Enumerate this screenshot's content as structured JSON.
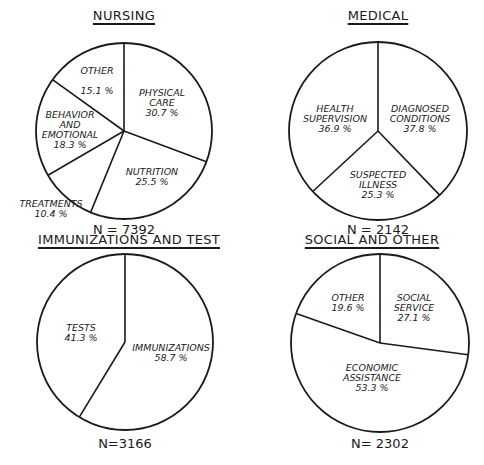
{
  "chart_data": [
    {
      "type": "pie",
      "title": "NURSING",
      "n_label": "N = 7392",
      "categories": [
        "PHYSICAL CARE",
        "NUTRITION",
        "TREATMENTS",
        "BEHAVIOR AND EMOTIONAL",
        "OTHER"
      ],
      "values": [
        30.7,
        25.5,
        10.4,
        18.3,
        15.1
      ],
      "value_labels": [
        "30.7 %",
        "25.5 %",
        "10.4 %",
        "18.3 %",
        "15.1 %"
      ],
      "start_angle": "top, clockwise"
    },
    {
      "type": "pie",
      "title": "MEDICAL",
      "n_label": "N = 2142",
      "categories": [
        "DIAGNOSED CONDITIONS",
        "SUSPECTED ILLNESS",
        "HEALTH SUPERVISION"
      ],
      "values": [
        37.8,
        25.3,
        36.9
      ],
      "value_labels": [
        "37.8 %",
        "25.3 %",
        "36.9 %"
      ],
      "start_angle": "top, clockwise"
    },
    {
      "type": "pie",
      "title": "IMMUNIZATIONS AND TEST",
      "n_label": "N=3166",
      "categories": [
        "IMMUNIZATIONS",
        "TESTS"
      ],
      "values": [
        58.7,
        41.3
      ],
      "value_labels": [
        "58.7 %",
        "41.3 %"
      ],
      "start_angle": "top, clockwise"
    },
    {
      "type": "pie",
      "title": "SOCIAL AND OTHER",
      "n_label": "N= 2302",
      "categories": [
        "SOCIAL SERVICE",
        "ECONOMIC ASSISTANCE",
        "OTHER"
      ],
      "values": [
        27.1,
        53.3,
        19.6
      ],
      "value_labels": [
        "27.1 %",
        "53.3 %",
        "19.6 %"
      ],
      "start_angle": "top, clockwise"
    }
  ],
  "charts": [
    {
      "title": "NURSING",
      "title_pos": [
        124,
        8
      ],
      "n_label": "N = 7392",
      "n_pos": [
        124,
        222
      ],
      "cx": 124,
      "cy": 131,
      "r": 88,
      "values": [
        30.7,
        25.5,
        10.4,
        18.3,
        15.1
      ],
      "labels": [
        {
          "lines": [
            "PHYSICAL",
            "CARE",
            "30.7 %"
          ],
          "pos": [
            162,
            88
          ]
        },
        {
          "lines": [
            "NUTRITION",
            "25.5 %"
          ],
          "pos": [
            152,
            167
          ]
        },
        {
          "lines": [
            "TREATMENTS",
            "10.4 %"
          ],
          "pos": [
            51,
            199
          ]
        },
        {
          "lines": [
            "BEHAVIOR",
            "AND",
            "EMOTIONAL",
            "18.3 %"
          ],
          "pos": [
            70,
            110
          ]
        },
        {
          "lines": [
            "OTHER",
            "",
            "15.1 %"
          ],
          "pos": [
            97,
            66
          ]
        }
      ]
    },
    {
      "title": "MEDICAL",
      "title_pos": [
        378,
        8
      ],
      "n_label": "N = 2142",
      "n_pos": [
        378,
        222
      ],
      "cx": 378,
      "cy": 131,
      "r": 89,
      "values": [
        37.8,
        25.3,
        36.9
      ],
      "labels": [
        {
          "lines": [
            "DIAGNOSED",
            "CONDITIONS",
            "37.8 %"
          ],
          "pos": [
            420,
            104
          ]
        },
        {
          "lines": [
            "SUSPECTED",
            "ILLNESS",
            "25.3 %"
          ],
          "pos": [
            378,
            170
          ]
        },
        {
          "lines": [
            "HEALTH",
            "SUPERVISION",
            "36.9 %"
          ],
          "pos": [
            335,
            104
          ]
        }
      ]
    },
    {
      "title": "IMMUNIZATIONS AND TEST",
      "title_pos": [
        129,
        232
      ],
      "n_label": "N=3166",
      "n_pos": [
        125,
        436
      ],
      "cx": 125,
      "cy": 342,
      "r": 88,
      "values": [
        58.7,
        41.3
      ],
      "labels": [
        {
          "lines": [
            "IMMUNIZATIONS",
            "58.7 %"
          ],
          "pos": [
            171,
            343
          ]
        },
        {
          "lines": [
            "TESTS",
            "41.3 %"
          ],
          "pos": [
            81,
            323
          ]
        }
      ]
    },
    {
      "title": "SOCIAL AND OTHER",
      "title_pos": [
        372,
        232
      ],
      "n_label": "N= 2302",
      "n_pos": [
        380,
        436
      ],
      "cx": 380,
      "cy": 343,
      "r": 89,
      "values": [
        27.1,
        53.3,
        19.6
      ],
      "labels": [
        {
          "lines": [
            "SOCIAL",
            "SERVICE",
            "27.1 %"
          ],
          "pos": [
            414,
            293
          ]
        },
        {
          "lines": [
            "ECONOMIC",
            "ASSISTANCE",
            "53.3 %"
          ],
          "pos": [
            372,
            363
          ]
        },
        {
          "lines": [
            "OTHER",
            "19.6 %"
          ],
          "pos": [
            348,
            293
          ]
        }
      ]
    }
  ]
}
